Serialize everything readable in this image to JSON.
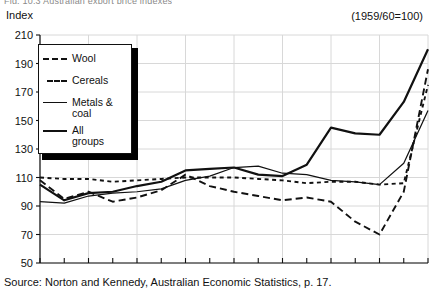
{
  "figure": {
    "cut_title": "Fig. 10.3   Australian export price indexes",
    "axis_title": "Index",
    "base_note": "(1959/60=100)",
    "source": "Source: Norton and Kennedy, Australian Economic Statistics, p. 17."
  },
  "legend": {
    "position": "top-left-inside",
    "items": [
      {
        "label": "Wool",
        "style": "long-dashed"
      },
      {
        "label": "Cereals",
        "style": "short-dashed"
      },
      {
        "label": "Metals &\ncoal",
        "style": "thin-solid"
      },
      {
        "label": "All\ngroups",
        "style": "thick-solid"
      }
    ]
  },
  "chart_data": {
    "type": "line",
    "title": "Australian export price indexes",
    "xlabel": "",
    "ylabel": "Index",
    "base_note": "(1959/60=100)",
    "ylim": [
      50,
      210
    ],
    "ytick_step": 20,
    "yticks": [
      50,
      70,
      90,
      110,
      130,
      150,
      170,
      190,
      210
    ],
    "grid": true,
    "x": [
      "1957-58",
      "1958-59",
      "1959-60",
      "1960-61",
      "1961-62",
      "1962-63",
      "1963-64",
      "1964-65",
      "1965-66",
      "1966-67",
      "1967-68",
      "1968-69",
      "1969-70",
      "1970-71",
      "1971-72",
      "1972-73",
      "1973-74"
    ],
    "xtick_labels": [
      "1957-58",
      "1959-60",
      "1961-62",
      "1963-64",
      "1965-66",
      "1967-68",
      "1969-70",
      "1971-72",
      "1973-74"
    ],
    "series": [
      {
        "name": "Wool",
        "style": "long-dashed",
        "values": [
          108,
          95,
          100,
          93,
          96,
          101,
          112,
          104,
          100,
          97,
          94,
          96,
          93,
          79,
          70,
          100,
          186
        ]
      },
      {
        "name": "Cereals",
        "style": "short-dashed",
        "values": [
          110,
          109,
          109,
          107,
          108,
          109,
          110,
          110,
          110,
          109,
          108,
          106,
          107,
          107,
          105,
          106,
          175
        ]
      },
      {
        "name": "Metals & coal",
        "style": "thin-solid",
        "values": [
          93,
          92,
          97,
          99,
          100,
          102,
          108,
          111,
          117,
          118,
          113,
          112,
          108,
          107,
          105,
          120,
          157
        ]
      },
      {
        "name": "All groups",
        "style": "thick-solid",
        "values": [
          105,
          94,
          99,
          100,
          104,
          107,
          115,
          116,
          117,
          112,
          111,
          119,
          145,
          141,
          140,
          163,
          200
        ]
      }
    ]
  }
}
